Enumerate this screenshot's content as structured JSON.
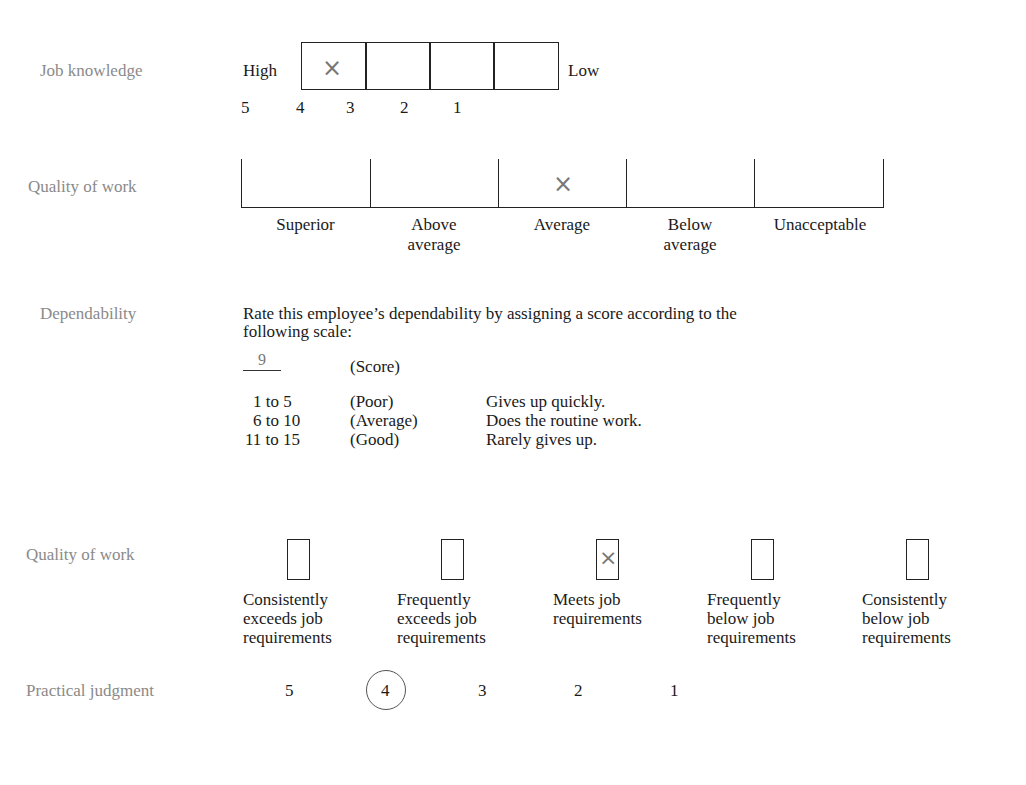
{
  "job_knowledge": {
    "label": "Job knowledge",
    "high": "High",
    "low": "Low",
    "ticks": [
      "5",
      "4",
      "3",
      "2",
      "1"
    ],
    "mark": "×",
    "marked_cell": 0
  },
  "quality_of_work_1": {
    "label": "Quality of work",
    "options": [
      "Superior",
      "Above\naverage",
      "Average",
      "Below\naverage",
      "Unacceptable"
    ],
    "option_lines": [
      [
        "Superior"
      ],
      [
        "Above",
        "average"
      ],
      [
        "Average"
      ],
      [
        "Below",
        "average"
      ],
      [
        "Unacceptable"
      ]
    ],
    "mark": "×",
    "marked_index": 2
  },
  "dependability": {
    "label": "Dependability",
    "instruction_line1": "Rate this employee’s dependability by assigning a score according to the",
    "instruction_line2": "following scale:",
    "score_value": "9",
    "score_label": "(Score)",
    "scale": [
      {
        "range": "1 to 5",
        "level": "(Poor)",
        "description": "Gives up quickly."
      },
      {
        "range": "6 to 10",
        "level": "(Average)",
        "description": "Does the routine work."
      },
      {
        "range": "11 to 15",
        "level": "(Good)",
        "description": "Rarely gives up."
      }
    ]
  },
  "quality_of_work_2": {
    "label": "Quality of work",
    "mark": "×",
    "marked_index": 2,
    "options": [
      {
        "lines": [
          "Consistently",
          "exceeds job",
          "requirements"
        ]
      },
      {
        "lines": [
          "Frequently",
          "exceeds job",
          "requirements"
        ]
      },
      {
        "lines": [
          "Meets job",
          "requirements"
        ]
      },
      {
        "lines": [
          "Frequently",
          "below job",
          "requirements"
        ]
      },
      {
        "lines": [
          "Consistently",
          "below job",
          "requirements"
        ]
      }
    ]
  },
  "practical_judgment": {
    "label": "Practical judgment",
    "values": [
      "5",
      "4",
      "3",
      "2",
      "1"
    ],
    "circled_index": 1
  }
}
